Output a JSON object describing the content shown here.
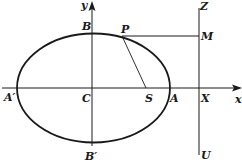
{
  "diagram": {
    "type": "ellipse-focus-directrix",
    "colors": {
      "stroke": "#1a1a1a",
      "background": "#ffffff"
    },
    "axes": {
      "x_label": "x",
      "y_label": "y"
    },
    "points": {
      "B": "B",
      "P": "P",
      "Z": "Z",
      "M": "M",
      "A_prime": "A′",
      "C": "C",
      "S": "S",
      "A": "A",
      "X": "X",
      "B_prime": "B′",
      "U": "U"
    }
  }
}
